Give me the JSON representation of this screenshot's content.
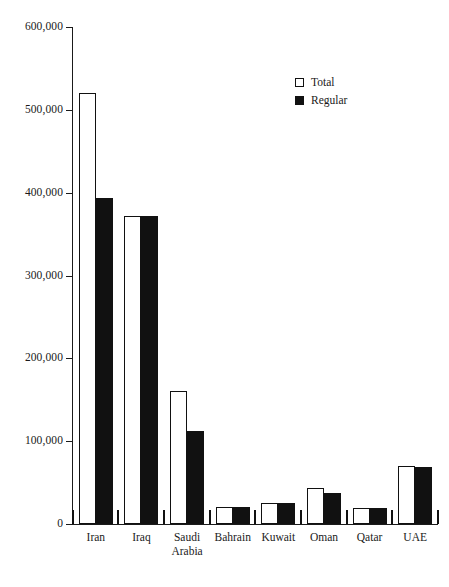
{
  "chart_data": {
    "type": "bar",
    "title": "",
    "subtitle": "",
    "xlabel": "",
    "ylabel": "",
    "ylim": [
      0,
      600000
    ],
    "ytick_interval": 100000,
    "ytick_labels": [
      "0",
      "100,000",
      "200,000",
      "300,000",
      "400,000",
      "500,000",
      "600,000"
    ],
    "ytick_values": [
      0,
      100000,
      200000,
      300000,
      400000,
      500000,
      600000
    ],
    "grid": false,
    "legend_position": "top-right",
    "categories": [
      "Iran",
      "Iraq",
      "Saudi Arabia",
      "Bahrain",
      "Kuwait",
      "Oman",
      "Qatar",
      "UAE"
    ],
    "category_lines": [
      [
        "Iran"
      ],
      [
        "Iraq"
      ],
      [
        "Saudi",
        "Arabia"
      ],
      [
        "Bahrain"
      ],
      [
        "Kuwait"
      ],
      [
        "Oman"
      ],
      [
        "Qatar"
      ],
      [
        "UAE"
      ]
    ],
    "series": [
      {
        "name": "Total",
        "style": "open",
        "color": "#ffffff",
        "edge_color": "#111111",
        "values": [
          520000,
          372000,
          161000,
          20000,
          25000,
          43000,
          19000,
          70000
        ]
      },
      {
        "name": "Regular",
        "style": "filled",
        "color": "#111111",
        "edge_color": "#111111",
        "values": [
          393000,
          372000,
          112000,
          20000,
          25000,
          38000,
          19000,
          69000
        ]
      }
    ]
  },
  "legend": {
    "items": [
      {
        "label": "Total",
        "style": "open"
      },
      {
        "label": "Regular",
        "style": "filled"
      }
    ]
  },
  "colors": {
    "ink": "#1a1a1a",
    "bar_fill": "#111111",
    "background": "#ffffff"
  }
}
